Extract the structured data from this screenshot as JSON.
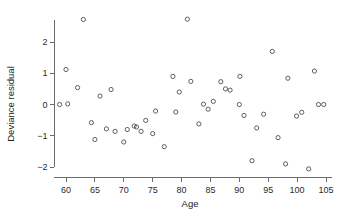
{
  "chart_data": {
    "type": "scatter",
    "title": "",
    "xlabel": "Age",
    "ylabel": "Deviance residual",
    "xlim": [
      58,
      106
    ],
    "ylim": [
      -2.35,
      2.95
    ],
    "grid": false,
    "legend": "none",
    "xticks": [
      60,
      65,
      70,
      75,
      80,
      85,
      90,
      95,
      100,
      105
    ],
    "xticklabels": [
      "60",
      "65",
      "70",
      "75",
      "80",
      "85",
      "90",
      "95",
      "100",
      "105"
    ],
    "yticks": [
      2,
      1,
      0,
      -1,
      -2
    ],
    "yticklabels": [
      "2",
      "1",
      "0",
      "−1",
      "−2"
    ],
    "marker": "open-circle",
    "marker_color": "#4d4d4d",
    "points": [
      {
        "x": 58.9,
        "y": 0.0
      },
      {
        "x": 60.0,
        "y": 1.12
      },
      {
        "x": 60.3,
        "y": 0.02
      },
      {
        "x": 62.0,
        "y": 0.54
      },
      {
        "x": 63.0,
        "y": 2.72
      },
      {
        "x": 64.4,
        "y": -0.58
      },
      {
        "x": 65.0,
        "y": -1.12
      },
      {
        "x": 65.9,
        "y": 0.27
      },
      {
        "x": 67.0,
        "y": -0.78
      },
      {
        "x": 67.8,
        "y": 0.48
      },
      {
        "x": 68.5,
        "y": -0.86
      },
      {
        "x": 70.0,
        "y": -1.2
      },
      {
        "x": 70.6,
        "y": -0.8
      },
      {
        "x": 71.8,
        "y": -0.69
      },
      {
        "x": 72.2,
        "y": -0.72
      },
      {
        "x": 73.0,
        "y": -0.86
      },
      {
        "x": 73.8,
        "y": -0.51
      },
      {
        "x": 75.0,
        "y": -0.93
      },
      {
        "x": 75.5,
        "y": -0.21
      },
      {
        "x": 77.0,
        "y": -1.35
      },
      {
        "x": 78.5,
        "y": 0.9
      },
      {
        "x": 79.0,
        "y": -0.24
      },
      {
        "x": 79.6,
        "y": 0.4
      },
      {
        "x": 81.0,
        "y": 2.73
      },
      {
        "x": 81.6,
        "y": 0.74
      },
      {
        "x": 83.0,
        "y": -0.62
      },
      {
        "x": 83.8,
        "y": 0.01
      },
      {
        "x": 84.6,
        "y": -0.15
      },
      {
        "x": 85.5,
        "y": 0.1
      },
      {
        "x": 86.8,
        "y": 0.73
      },
      {
        "x": 87.6,
        "y": 0.5
      },
      {
        "x": 88.4,
        "y": 0.46
      },
      {
        "x": 90.0,
        "y": 0.0
      },
      {
        "x": 90.1,
        "y": 0.9
      },
      {
        "x": 90.8,
        "y": -0.35
      },
      {
        "x": 92.2,
        "y": -1.8
      },
      {
        "x": 93.0,
        "y": -0.75
      },
      {
        "x": 94.2,
        "y": -0.31
      },
      {
        "x": 95.7,
        "y": 1.7
      },
      {
        "x": 96.7,
        "y": -1.06
      },
      {
        "x": 98.0,
        "y": -1.9
      },
      {
        "x": 98.4,
        "y": 0.84
      },
      {
        "x": 99.9,
        "y": -0.37
      },
      {
        "x": 100.8,
        "y": -0.25
      },
      {
        "x": 102.0,
        "y": -2.06
      },
      {
        "x": 103.0,
        "y": 1.07
      },
      {
        "x": 103.7,
        "y": 0.0
      },
      {
        "x": 104.6,
        "y": 0.0
      }
    ]
  }
}
